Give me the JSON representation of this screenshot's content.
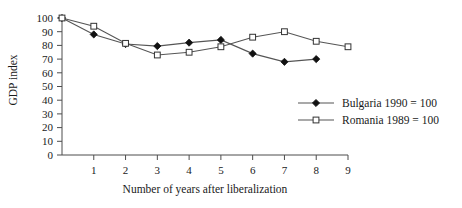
{
  "chart_data": {
    "type": "line",
    "title": "",
    "xlabel": "Number of years after liberalization",
    "ylabel": "GDP index",
    "xlim": [
      0,
      9
    ],
    "ylim": [
      0,
      100
    ],
    "xticks": [
      0,
      1,
      2,
      3,
      4,
      5,
      6,
      7,
      8,
      9
    ],
    "xtick_labels": [
      "0",
      "1",
      "2",
      "3",
      "4",
      "5",
      "6",
      "7",
      "8",
      "9"
    ],
    "yticks": [
      0,
      10,
      20,
      30,
      40,
      50,
      60,
      70,
      80,
      90,
      100
    ],
    "ytick_labels": [
      "0",
      "10",
      "20",
      "30",
      "40",
      "50",
      "60",
      "70",
      "80",
      "90",
      "100"
    ],
    "grid": false,
    "legend_position": "right-middle",
    "x": [
      0,
      1,
      2,
      3,
      4,
      5,
      6,
      7,
      8,
      9
    ],
    "series": [
      {
        "name": "Bulgaria 1990 = 100",
        "marker": "filled-diamond",
        "color": "#111111",
        "x": [
          0,
          1,
          2,
          3,
          4,
          5,
          6,
          7,
          8
        ],
        "values": [
          100,
          88,
          81,
          79.5,
          82,
          84,
          74,
          68,
          70
        ]
      },
      {
        "name": "Romania 1989 = 100",
        "marker": "open-square",
        "color": "#333333",
        "x": [
          0,
          1,
          2,
          3,
          4,
          5,
          6,
          7,
          8,
          9
        ],
        "values": [
          100,
          94,
          81.5,
          73,
          75,
          79,
          86,
          90,
          83,
          79
        ]
      }
    ]
  },
  "legend": {
    "items": [
      {
        "label": "Bulgaria 1990 = 100"
      },
      {
        "label": "Romania 1989 = 100"
      }
    ]
  }
}
